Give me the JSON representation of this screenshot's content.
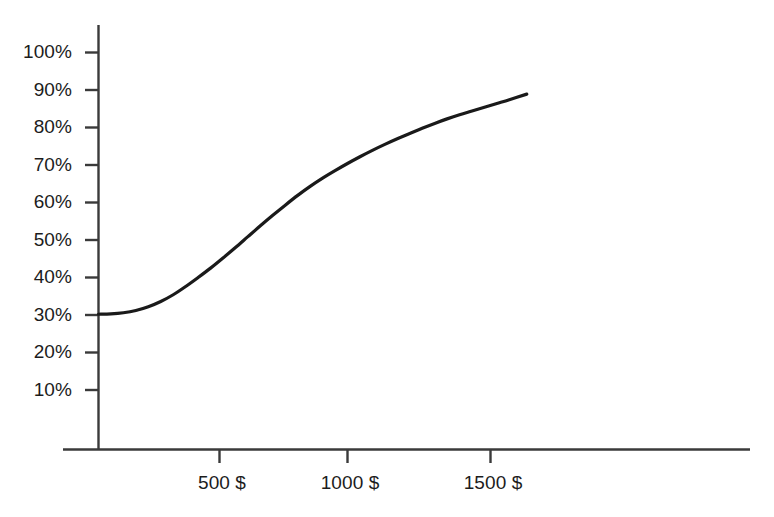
{
  "chart_data": {
    "type": "line",
    "title": "",
    "subtitle": "",
    "xlabel": "",
    "ylabel": "",
    "x_tick_labels": [
      "500 $",
      "1000 $",
      "1500 $"
    ],
    "x_tick_values": [
      500,
      1000,
      1500
    ],
    "y_tick_labels": [
      "10%",
      "20%",
      "30%",
      "40%",
      "50%",
      "60%",
      "70%",
      "80%",
      "90%",
      "100%"
    ],
    "y_tick_values": [
      10,
      20,
      30,
      40,
      50,
      60,
      70,
      80,
      90,
      100
    ],
    "xlim": [
      0,
      1950
    ],
    "ylim": [
      0,
      112
    ],
    "grid": false,
    "legend": null,
    "annotations": [],
    "series": [
      {
        "name": "response curve",
        "x": [
          0,
          50,
          100,
          150,
          200,
          250,
          300,
          350,
          400,
          450,
          500,
          550,
          600,
          650,
          700,
          750,
          800,
          850,
          900,
          950,
          1000,
          1050,
          1100,
          1150,
          1200,
          1250,
          1300,
          1350,
          1400,
          1450,
          1500,
          1550,
          1600,
          1650,
          1720
        ],
        "y": [
          30.2,
          30.3,
          30.6,
          31.2,
          32.2,
          33.6,
          35.4,
          37.6,
          40.0,
          42.5,
          45.2,
          48.0,
          50.9,
          53.8,
          56.6,
          59.3,
          61.9,
          64.3,
          66.5,
          68.5,
          70.4,
          72.2,
          73.9,
          75.5,
          77.0,
          78.4,
          79.8,
          81.1,
          82.3,
          83.4,
          84.4,
          85.4,
          86.4,
          87.4,
          88.9
        ]
      }
    ],
    "colors": {
      "line": "#1a1a1a",
      "axis": "#3a3a3a",
      "background": "#ffffff",
      "text": "#1c1c1c"
    }
  },
  "axes": {
    "y_ticks": [
      {
        "label": "100%",
        "value": 100
      },
      {
        "label": "90%",
        "value": 90
      },
      {
        "label": "80%",
        "value": 80
      },
      {
        "label": "70%",
        "value": 70
      },
      {
        "label": "60%",
        "value": 60
      },
      {
        "label": "50%",
        "value": 50
      },
      {
        "label": "40%",
        "value": 40
      },
      {
        "label": "30%",
        "value": 30
      },
      {
        "label": "20%",
        "value": 20
      },
      {
        "label": "10%",
        "value": 10
      }
    ],
    "x_ticks": [
      {
        "label": "500 $",
        "value": 500
      },
      {
        "label": "1000 $",
        "value": 1000
      },
      {
        "label": "1500 $",
        "value": 1500
      }
    ]
  }
}
